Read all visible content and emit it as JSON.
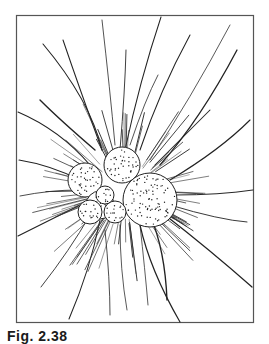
{
  "figure": {
    "caption": "Fig. 2.38",
    "colors": {
      "ink": "#1a1a1a",
      "paper": "#ffffff",
      "frame": "#555555"
    }
  }
}
